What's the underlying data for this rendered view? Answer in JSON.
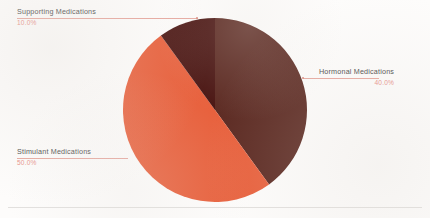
{
  "chart_data": {
    "type": "pie",
    "title": "",
    "subtitle": "",
    "xlabel": "",
    "ylabel": "",
    "legend_position": "callout-labels",
    "grid": false,
    "value_suffix": "%",
    "total": 100,
    "categories": [
      "Hormonal Medications",
      "Stimulant Medications",
      "Supporting Medications"
    ],
    "values": [
      40.0,
      50.0,
      10.0
    ],
    "slices": [
      {
        "label": "Hormonal Medications",
        "value": 40.0,
        "value_text": "40.0%",
        "color": "#5c2a22",
        "start_angle_deg": 0,
        "end_angle_deg": 144,
        "callout_side": "right"
      },
      {
        "label": "Stimulant Medications",
        "value": 50.0,
        "value_text": "50.0%",
        "color": "#e8603c",
        "start_angle_deg": 144,
        "end_angle_deg": 324,
        "callout_side": "left-bottom"
      },
      {
        "label": "Supporting Medications",
        "value": 10.0,
        "value_text": "10.0%",
        "color": "#4a1512",
        "start_angle_deg": 324,
        "end_angle_deg": 360,
        "callout_side": "left-top"
      }
    ]
  },
  "colors": {
    "background": "#fdfcfb",
    "hormonal": "#5c2a22",
    "stimulant": "#e8603c",
    "supporting": "#4a1512",
    "label_text": "#4a4a4a",
    "value_text": "#e8918a",
    "leader_line": "#e7a89f",
    "baseline_rule": "#e2e0de"
  },
  "geometry": {
    "center_x": 215,
    "center_y": 110,
    "radius": 92
  }
}
